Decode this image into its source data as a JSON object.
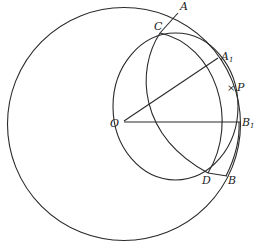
{
  "diagram": {
    "type": "geometry-construction",
    "points": {
      "A": {
        "label": "A",
        "sub": ""
      },
      "A1": {
        "label": "A",
        "sub": "1"
      },
      "B": {
        "label": "B",
        "sub": ""
      },
      "B1": {
        "label": "B",
        "sub": "1"
      },
      "C": {
        "label": "C",
        "sub": ""
      },
      "D": {
        "label": "D",
        "sub": ""
      },
      "O": {
        "label": "O",
        "sub": ""
      },
      "P": {
        "label": "P",
        "sub": ""
      }
    },
    "marker_P": "×",
    "stroke_color": "#2a2a2a",
    "background": "#ffffff"
  }
}
